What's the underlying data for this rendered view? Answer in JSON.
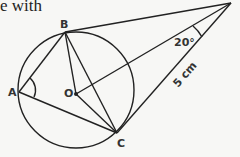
{
  "header": {
    "partial_text": "e with"
  },
  "diagram": {
    "points": {
      "A": "A",
      "B": "B",
      "C": "C",
      "O": "O"
    },
    "angle_label": "20°",
    "length_label": "5 cm"
  }
}
